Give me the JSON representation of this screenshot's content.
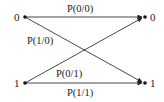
{
  "diagram": {
    "type": "binary-channel",
    "colors": {
      "line": "#333333",
      "text": "#222222",
      "background": "#ffffff"
    },
    "inputs": [
      {
        "id": "in0",
        "label": "0"
      },
      {
        "id": "in1",
        "label": "1"
      }
    ],
    "outputs": [
      {
        "id": "out0",
        "label": "0"
      },
      {
        "id": "out1",
        "label": "1"
      }
    ],
    "edges": [
      {
        "from": "in0",
        "to": "out0",
        "label": "P(0/0)"
      },
      {
        "from": "in0",
        "to": "out1",
        "label": "P(1/0)"
      },
      {
        "from": "in1",
        "to": "out0",
        "label": "P(0/1)"
      },
      {
        "from": "in1",
        "to": "out1",
        "label": "P(1/1)"
      }
    ]
  }
}
